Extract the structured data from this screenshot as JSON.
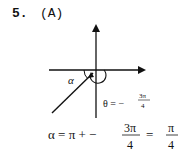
{
  "problem": {
    "number": "5.",
    "answer": "(A)"
  },
  "diagram": {
    "alpha_label": "α",
    "theta_eq": "θ = −",
    "theta_num": "3π",
    "theta_den": "4"
  },
  "equation": {
    "lhs": "α = π + −",
    "frac1_num": "3π",
    "frac1_den": "4",
    "eq": "=",
    "frac2_num": "π",
    "frac2_den": "4"
  }
}
